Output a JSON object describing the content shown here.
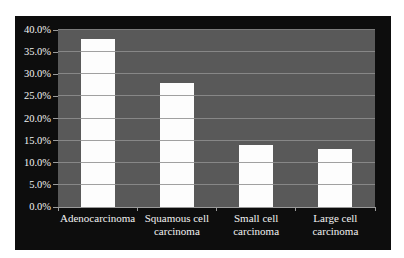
{
  "chart": {
    "background_color": "#ffffff",
    "frame_color": "#0d0d0d",
    "plot_color": "#595959",
    "gridline_color": "#8f8f8f",
    "bar_color": "#fdfdfd",
    "text_color": "#f2f2f2",
    "axis_color": "#9a9a9a"
  },
  "chart_data": {
    "type": "bar",
    "title": "",
    "xlabel": "",
    "ylabel": "",
    "categories": [
      "Adenocarcinoma",
      "Squamous cell carcinoma",
      "Small cell carcinoma",
      "Large cell carcinoma"
    ],
    "category_label_lines": [
      [
        "Adenocarcinoma"
      ],
      [
        "Squamous cell",
        "carcinoma"
      ],
      [
        "Small cell",
        "carcinoma"
      ],
      [
        "Large cell",
        "carcinoma"
      ]
    ],
    "values": [
      38.0,
      28.0,
      14.0,
      13.0
    ],
    "unit": "%",
    "ylim": [
      0,
      40
    ],
    "ytick_step": 5,
    "ytick_labels": [
      "0.0%",
      "5.0%",
      "10.0%",
      "15.0%",
      "20.0%",
      "25.0%",
      "30.0%",
      "35.0%",
      "40.0%"
    ],
    "grid": true,
    "legend_position": "none"
  }
}
